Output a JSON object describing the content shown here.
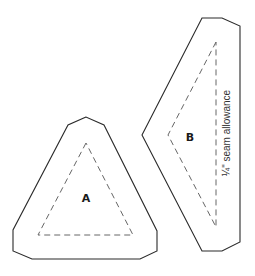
{
  "diagram": {
    "type": "quilt-template",
    "pieces": [
      {
        "id": "A",
        "label": "A",
        "outer_points": "86,117 68,125 13,230 13,251 32,259 140,259 157,251 157,231 104,125",
        "inner_points": "86,143 38,235 133,235",
        "label_pos": [
          86,
          202
        ]
      },
      {
        "id": "B",
        "label": "B",
        "outer_points": "202,18 222,18 240,26 240,242 222,251 202,251 142,135",
        "inner_points": "216,42 168,135 216,227",
        "label_pos": [
          190,
          141
        ]
      }
    ],
    "annotation": {
      "text": "¼\" seam allowance",
      "x": 230,
      "y": 133
    },
    "colors": {
      "outline": "#2a2a2a",
      "dashed": "#666666"
    }
  }
}
